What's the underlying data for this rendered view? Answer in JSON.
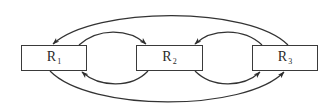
{
  "diagram": {
    "type": "directed-graph",
    "colors": {
      "background": "#ffffff",
      "stroke": "#333333",
      "text": "#2a2a2a"
    },
    "nodes": [
      {
        "id": "R1",
        "label": "R",
        "subscript": "1",
        "x": 21,
        "y": 45,
        "w": 66,
        "h": 26
      },
      {
        "id": "R2",
        "label": "R",
        "subscript": "2",
        "x": 136,
        "y": 45,
        "w": 67,
        "h": 26
      },
      {
        "id": "R3",
        "label": "R",
        "subscript": "3",
        "x": 252,
        "y": 45,
        "w": 66,
        "h": 26
      }
    ],
    "edges": [
      {
        "id": "e-r1-r2",
        "from": "R1",
        "to": "R2",
        "route": "inner-top"
      },
      {
        "id": "e-r2-r1",
        "from": "R2",
        "to": "R1",
        "route": "inner-bottom"
      },
      {
        "id": "e-r3-r2",
        "from": "R3",
        "to": "R2",
        "route": "inner-top"
      },
      {
        "id": "e-r2-r3",
        "from": "R2",
        "to": "R3",
        "route": "inner-bottom"
      },
      {
        "id": "e-r3-r1",
        "from": "R3",
        "to": "R1",
        "route": "outer-top"
      },
      {
        "id": "e-r1-r3",
        "from": "R1",
        "to": "R3",
        "route": "outer-bottom"
      }
    ]
  }
}
